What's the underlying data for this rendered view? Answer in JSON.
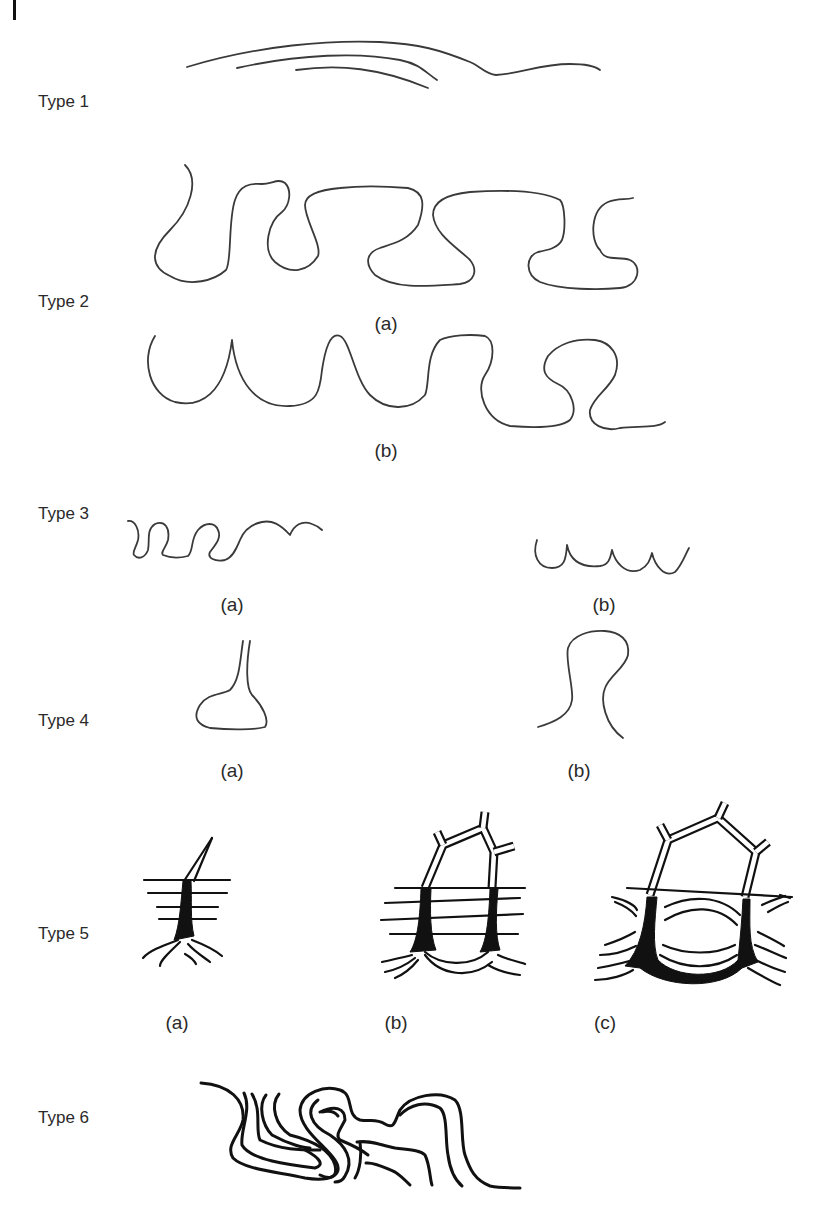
{
  "figure": {
    "rows": [
      {
        "id": "type1",
        "label": "Type 1",
        "subfigures": []
      },
      {
        "id": "type2",
        "label": "Type 2",
        "subfigures": [
          "(a)",
          "(b)"
        ]
      },
      {
        "id": "type3",
        "label": "Type 3",
        "subfigures": [
          "(a)",
          "(b)"
        ]
      },
      {
        "id": "type4",
        "label": "Type 4",
        "subfigures": [
          "(a)",
          "(b)"
        ]
      },
      {
        "id": "type5",
        "label": "Type 5",
        "subfigures": [
          "(a)",
          "(b)",
          "(c)"
        ]
      },
      {
        "id": "type6",
        "label": "Type 6",
        "subfigures": []
      }
    ],
    "colors": {
      "line": "#3a3a3a",
      "ink": "#111111",
      "background": "#ffffff"
    }
  }
}
